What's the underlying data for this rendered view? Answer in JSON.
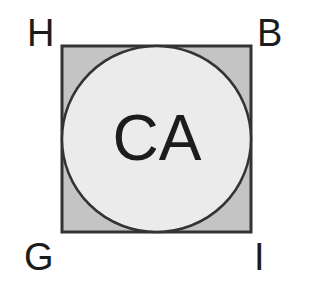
{
  "diagram": {
    "corners": {
      "top_left": "H",
      "top_right": "B",
      "bottom_left": "G",
      "bottom_right": "I"
    },
    "circle_label": "CA",
    "colors": {
      "square_fill": "#c4c4c4",
      "circle_fill": "#ebebeb",
      "stroke": "#333333",
      "text": "#1c1c1c"
    }
  }
}
